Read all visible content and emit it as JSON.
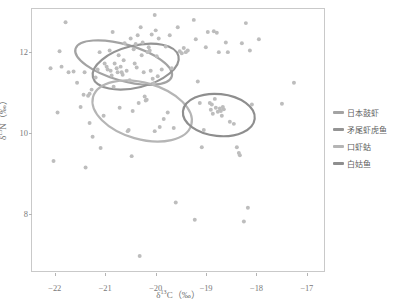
{
  "chart_data": {
    "type": "scatter",
    "title": "",
    "subtitle": "",
    "xlabel_html": "δ<sup>13</sup>C（‰）",
    "ylabel_html": "δ<sup>15</sup>N（‰）",
    "xlabel_text": "δ13C（‰）",
    "ylabel_text": "δ15N（‰）",
    "xlim": [
      -22.45,
      -16.62
    ],
    "ylim": [
      6.55,
      13.05
    ],
    "xticks": [
      -22,
      -21,
      -20,
      -19,
      -18,
      -17
    ],
    "xtick_labels": [
      "−22",
      "−21",
      "−20",
      "−19",
      "−18",
      "−17"
    ],
    "yticks": [
      8,
      10,
      12
    ],
    "ytick_labels": [
      "8",
      "10",
      "12"
    ],
    "grid": false,
    "legend_position": "right",
    "point_color": "#bdbdbd",
    "point_size": 2.0,
    "frame_color": "#c9c9c9",
    "legend": [
      {
        "label": "日本鼓虾",
        "color": "#a3a3a3",
        "ellipse_index": 0
      },
      {
        "label": "矛尾虾虎鱼",
        "color": "#949494",
        "ellipse_index": 1
      },
      {
        "label": "口虾蛄",
        "color": "#b5b5b5",
        "ellipse_index": 2
      },
      {
        "label": "白姑鱼",
        "color": "#8e8e8e",
        "ellipse_index": 3
      }
    ],
    "ellipses": [
      {
        "name": "日本鼓虾",
        "cx": -20.62,
        "cy": 11.72,
        "rx": 1.0,
        "ry": 0.45,
        "angle": -16,
        "color": "#a3a3a3",
        "stroke_width": 2.2
      },
      {
        "name": "矛尾虾虎鱼",
        "cx": -20.38,
        "cy": 11.62,
        "rx": 0.88,
        "ry": 0.52,
        "angle": 14,
        "color": "#949494",
        "stroke_width": 2.2
      },
      {
        "name": "口虾蛄",
        "cx": -20.25,
        "cy": 10.52,
        "rx": 1.02,
        "ry": 0.7,
        "angle": -16,
        "color": "#b5b5b5",
        "stroke_width": 2.2
      },
      {
        "name": "白姑鱼",
        "cx": -18.72,
        "cy": 10.42,
        "rx": 0.72,
        "ry": 0.52,
        "angle": -6,
        "color": "#8e8e8e",
        "stroke_width": 2.2
      }
    ],
    "points": [
      [
        -21.78,
        12.72
      ],
      [
        -21.9,
        12.0
      ],
      [
        -21.86,
        11.62
      ],
      [
        -21.72,
        11.48
      ],
      [
        -21.62,
        11.5
      ],
      [
        -21.55,
        11.22
      ],
      [
        -21.48,
        10.62
      ],
      [
        -21.42,
        10.92
      ],
      [
        -21.4,
        11.48
      ],
      [
        -21.33,
        10.9
      ],
      [
        -21.3,
        10.95
      ],
      [
        -21.26,
        11.05
      ],
      [
        -21.3,
        10.22
      ],
      [
        -21.24,
        9.88
      ],
      [
        -21.18,
        11.35
      ],
      [
        -21.14,
        11.55
      ],
      [
        -21.1,
        11.98
      ],
      [
        -21.08,
        9.6
      ],
      [
        -21.02,
        10.4
      ],
      [
        -21.0,
        11.7
      ],
      [
        -20.96,
        11.62
      ],
      [
        -20.94,
        11.55
      ],
      [
        -20.9,
        12.02
      ],
      [
        -20.88,
        11.52
      ],
      [
        -20.86,
        11.4
      ],
      [
        -20.84,
        12.48
      ],
      [
        -20.82,
        11.12
      ],
      [
        -20.8,
        11.7
      ],
      [
        -20.76,
        11.58
      ],
      [
        -20.74,
        11.48
      ],
      [
        -20.72,
        11.9
      ],
      [
        -20.7,
        10.6
      ],
      [
        -20.68,
        11.62
      ],
      [
        -20.66,
        11.48
      ],
      [
        -20.64,
        11.42
      ],
      [
        -20.62,
        11.78
      ],
      [
        -20.6,
        12.2
      ],
      [
        -20.56,
        11.52
      ],
      [
        -20.54,
        10.02
      ],
      [
        -20.52,
        10.05
      ],
      [
        -20.5,
        11.28
      ],
      [
        -20.48,
        12.32
      ],
      [
        -20.46,
        9.4
      ],
      [
        -20.44,
        10.52
      ],
      [
        -20.42,
        12.05
      ],
      [
        -20.4,
        11.7
      ],
      [
        -20.38,
        12.18
      ],
      [
        -20.36,
        11.6
      ],
      [
        -20.34,
        12.4
      ],
      [
        -20.32,
        10.72
      ],
      [
        -20.3,
        6.92
      ],
      [
        -20.28,
        12.6
      ],
      [
        -20.26,
        11.9
      ],
      [
        -20.24,
        12.22
      ],
      [
        -20.22,
        11.48
      ],
      [
        -20.2,
        10.88
      ],
      [
        -20.18,
        10.78
      ],
      [
        -20.16,
        10.8
      ],
      [
        -20.14,
        11.98
      ],
      [
        -20.12,
        12.1
      ],
      [
        -20.1,
        12.02
      ],
      [
        -20.08,
        11.52
      ],
      [
        -20.06,
        12.42
      ],
      [
        -20.04,
        11.32
      ],
      [
        -20.02,
        11.2
      ],
      [
        -20.0,
        10.02
      ],
      [
        -20.0,
        12.9
      ],
      [
        -19.98,
        12.52
      ],
      [
        -19.96,
        11.88
      ],
      [
        -19.94,
        11.38
      ],
      [
        -19.92,
        12.32
      ],
      [
        -19.9,
        10.12
      ],
      [
        -19.86,
        11.55
      ],
      [
        -19.82,
        10.32
      ],
      [
        -19.78,
        12.12
      ],
      [
        -19.74,
        10.48
      ],
      [
        -19.7,
        12.4
      ],
      [
        -19.66,
        11.58
      ],
      [
        -19.62,
        10.1
      ],
      [
        -19.58,
        8.25
      ],
      [
        -19.54,
        12.6
      ],
      [
        -19.5,
        12.0
      ],
      [
        -19.46,
        11.95
      ],
      [
        -19.42,
        12.08
      ],
      [
        -19.38,
        11.98
      ],
      [
        -19.34,
        12.02
      ],
      [
        -19.22,
        12.78
      ],
      [
        -19.18,
        12.3
      ],
      [
        -19.14,
        11.25
      ],
      [
        -19.1,
        10.72
      ],
      [
        -19.06,
        9.62
      ],
      [
        -19.02,
        10.05
      ],
      [
        -18.98,
        12.1
      ],
      [
        -18.94,
        12.48
      ],
      [
        -18.9,
        10.72
      ],
      [
        -18.88,
        10.55
      ],
      [
        -18.86,
        10.68
      ],
      [
        -18.84,
        10.45
      ],
      [
        -18.82,
        12.5
      ],
      [
        -18.8,
        10.82
      ],
      [
        -18.78,
        10.6
      ],
      [
        -18.76,
        12.46
      ],
      [
        -18.74,
        10.5
      ],
      [
        -18.72,
        11.98
      ],
      [
        -18.7,
        10.58
      ],
      [
        -18.68,
        10.52
      ],
      [
        -18.66,
        10.4
      ],
      [
        -18.64,
        10.62
      ],
      [
        -18.62,
        10.56
      ],
      [
        -18.58,
        12.22
      ],
      [
        -18.54,
        11.98
      ],
      [
        -18.5,
        10.25
      ],
      [
        -18.42,
        10.2
      ],
      [
        -18.36,
        9.62
      ],
      [
        -18.32,
        9.48
      ],
      [
        -18.3,
        9.42
      ],
      [
        -18.26,
        12.2
      ],
      [
        -18.22,
        7.78
      ],
      [
        -18.18,
        12.7
      ],
      [
        -18.14,
        8.12
      ],
      [
        -18.1,
        12.02
      ],
      [
        -18.06,
        10.68
      ],
      [
        -17.92,
        12.3
      ],
      [
        -17.46,
        10.7
      ],
      [
        -17.22,
        11.22
      ],
      [
        -19.2,
        7.82
      ],
      [
        -22.02,
        9.28
      ],
      [
        -21.38,
        9.12
      ],
      [
        -22.08,
        11.58
      ],
      [
        -21.94,
        10.48
      ]
    ]
  }
}
